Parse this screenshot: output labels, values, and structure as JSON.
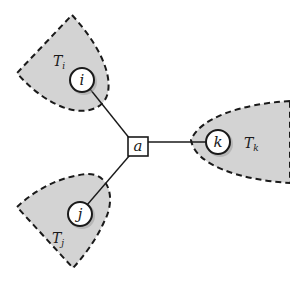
{
  "diagram": {
    "center_node": {
      "label": "a",
      "shape": "square"
    },
    "nodes": [
      {
        "id": "i",
        "label": "i",
        "subtree": {
          "label": "T",
          "subscript": "i"
        }
      },
      {
        "id": "j",
        "label": "j",
        "subtree": {
          "label": "T",
          "subscript": "j"
        }
      },
      {
        "id": "k",
        "label": "k",
        "subtree": {
          "label": "T",
          "subscript": "k"
        }
      }
    ],
    "edges": [
      {
        "from": "a",
        "to": "i"
      },
      {
        "from": "a",
        "to": "j"
      },
      {
        "from": "a",
        "to": "k"
      }
    ],
    "colors": {
      "region_fill": "#d3d3d3",
      "stroke": "#1a1a1a",
      "node_fill": "#ffffff"
    }
  }
}
